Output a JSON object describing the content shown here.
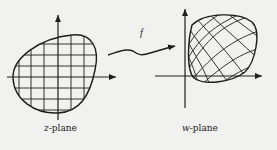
{
  "diagram": {
    "left_plane": {
      "var": "z",
      "suffix": "-plane"
    },
    "right_plane": {
      "var": "w",
      "suffix": "-plane"
    },
    "mapping_label": "f",
    "colors": {
      "ink": "#1e1e1e",
      "paper": "#f1f1ef"
    }
  }
}
